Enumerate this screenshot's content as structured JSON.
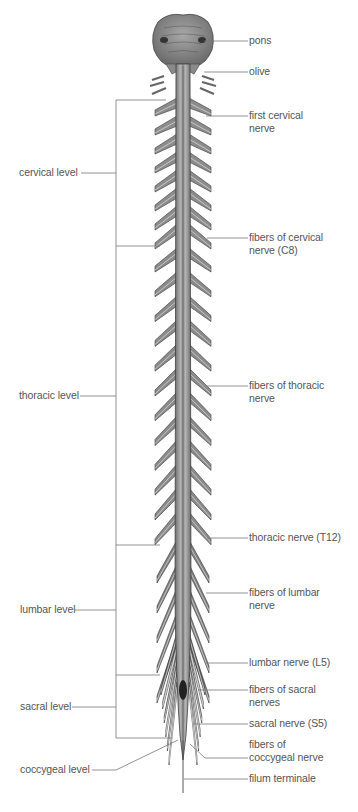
{
  "diagram": {
    "title": "",
    "colors": {
      "background": "#ffffff",
      "label_text": "#555555",
      "leader_line": "#777777",
      "cord_fill": "#9a9a9a",
      "cord_shadow": "#4a4a4a",
      "brainstem_fill": "#8f8f8f"
    },
    "left_labels": [
      {
        "id": "cervical",
        "text": "cervical level",
        "y": 173
      },
      {
        "id": "thoracic",
        "text": "thoracic level",
        "y": 396
      },
      {
        "id": "lumbar",
        "text": "lumbar level",
        "y": 610
      },
      {
        "id": "sacral",
        "text": "sacral level",
        "y": 707
      },
      {
        "id": "coccygeal",
        "text": "coccygeal level",
        "y": 770
      }
    ],
    "right_labels": [
      {
        "id": "pons",
        "text": "pons",
        "y": 41
      },
      {
        "id": "olive",
        "text": "olive",
        "y": 72
      },
      {
        "id": "first-cervical-nerve",
        "text": "first cervical\nnerve",
        "y": 116
      },
      {
        "id": "fibers-cervical-c8",
        "text": "fibers of cervical\nnerve (C8)",
        "y": 238
      },
      {
        "id": "fibers-thoracic",
        "text": "fibers of thoracic\nnerve",
        "y": 386
      },
      {
        "id": "thoracic-nerve-t12",
        "text": "thoracic nerve (T12)",
        "y": 538
      },
      {
        "id": "fibers-lumbar",
        "text": "fibers of lumbar\nnerve",
        "y": 593
      },
      {
        "id": "lumbar-nerve-l5",
        "text": "lumbar nerve (L5)",
        "y": 663
      },
      {
        "id": "fibers-sacral",
        "text": "fibers of sacral\nnerves",
        "y": 690
      },
      {
        "id": "sacral-nerve-s5",
        "text": "sacral nerve (S5)",
        "y": 724
      },
      {
        "id": "fibers-coccygeal",
        "text": "fibers of\ncoccygeal nerve",
        "y": 743
      },
      {
        "id": "filum-terminale",
        "text": "filum terminale",
        "y": 779
      }
    ],
    "brackets": [
      {
        "level": "cervical",
        "top": 100,
        "bottom": 246
      },
      {
        "level": "thoracic",
        "top": 246,
        "bottom": 545
      },
      {
        "level": "lumbar",
        "top": 545,
        "bottom": 675
      },
      {
        "level": "sacral",
        "top": 675,
        "bottom": 738
      }
    ]
  }
}
